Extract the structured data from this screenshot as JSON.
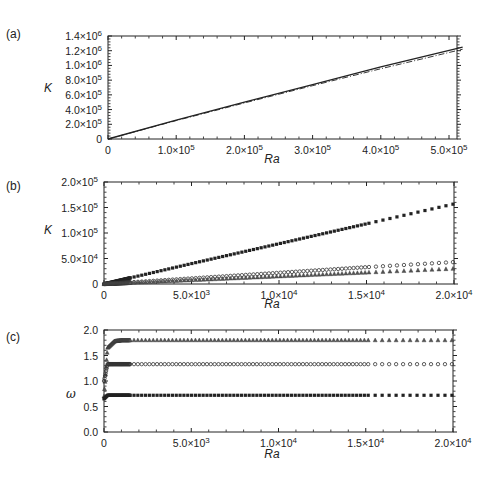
{
  "chart_data": [
    {
      "panel": "(a)",
      "type": "line",
      "title": "",
      "xlabel": "Ra",
      "ylabel": "K",
      "xlim": [
        0,
        530000
      ],
      "ylim": [
        0,
        1400000
      ],
      "xticks": [
        0,
        100000,
        200000,
        300000,
        400000,
        500000
      ],
      "xtick_labels": [
        "0",
        "1.0×10^5",
        "2.0×10^5",
        "3.0×10^5",
        "4.0×10^5",
        "5.0×10^5"
      ],
      "yticks": [
        0,
        200000,
        400000,
        600000,
        800000,
        1000000,
        1200000,
        1400000
      ],
      "ytick_labels": [
        "0",
        "2.0×10^5",
        "4.0×10^5",
        "6.0×10^5",
        "8.0×10^5",
        "1.0×10^6",
        "1.2×10^6",
        "1.4×10^6"
      ],
      "grid": false,
      "series": [
        {
          "name": "solid",
          "style": "solid",
          "x": [
            0,
            100000,
            200000,
            300000,
            400000,
            520000
          ],
          "values": [
            0,
            255000,
            500000,
            740000,
            980000,
            1250000
          ]
        },
        {
          "name": "dash-dot",
          "style": "dashdot",
          "x": [
            0,
            100000,
            200000,
            300000,
            400000,
            520000
          ],
          "values": [
            0,
            250000,
            490000,
            725000,
            955000,
            1220000
          ]
        }
      ]
    },
    {
      "panel": "(b)",
      "type": "scatter",
      "title": "",
      "xlabel": "Ra",
      "ylabel": "K",
      "xlim": [
        0,
        20000
      ],
      "ylim": [
        0,
        200000
      ],
      "xticks": [
        0,
        5000,
        10000,
        15000,
        20000
      ],
      "xtick_labels": [
        "0",
        "5.0×10^3",
        "1.0×10^4",
        "1.5×10^4",
        "2.0×10^4"
      ],
      "yticks": [
        0,
        50000,
        100000,
        150000,
        200000
      ],
      "ytick_labels": [
        "0",
        "5.0×10^4",
        "1.0×10^5",
        "1.5×10^5",
        "2.0×10^5"
      ],
      "grid": false,
      "series": [
        {
          "name": "squares",
          "marker": "square",
          "x": [
            0,
            5000,
            10000,
            15000,
            20000
          ],
          "values": [
            0,
            40000,
            79000,
            118000,
            157000
          ]
        },
        {
          "name": "circles",
          "marker": "circle",
          "x": [
            0,
            5000,
            10000,
            15000,
            20000
          ],
          "values": [
            0,
            11000,
            22000,
            33000,
            43000
          ]
        },
        {
          "name": "triangles",
          "marker": "triangle",
          "x": [
            0,
            5000,
            10000,
            15000,
            20000
          ],
          "values": [
            0,
            7500,
            15000,
            22500,
            30000
          ]
        }
      ]
    },
    {
      "panel": "(c)",
      "type": "scatter",
      "title": "",
      "xlabel": "Ra",
      "ylabel": "ω",
      "xlim": [
        0,
        20000
      ],
      "ylim": [
        0,
        2.0
      ],
      "xticks": [
        0,
        5000,
        10000,
        15000,
        20000
      ],
      "xtick_labels": [
        "0",
        "5.0×10^3",
        "1.0×10^4",
        "1.5×10^4",
        "2.0×10^4"
      ],
      "yticks": [
        0,
        0.5,
        1.0,
        1.5,
        2.0
      ],
      "ytick_labels": [
        "0.0",
        "0.5",
        "1.0",
        "1.5",
        "2.0"
      ],
      "grid": false,
      "series": [
        {
          "name": "triangles",
          "marker": "triangle",
          "x": [
            0,
            200,
            600,
            1000,
            20000
          ],
          "values": [
            0.7,
            1.65,
            1.78,
            1.8,
            1.8
          ]
        },
        {
          "name": "circles",
          "marker": "circle",
          "x": [
            0,
            200,
            20000
          ],
          "values": [
            1.0,
            1.33,
            1.33
          ]
        },
        {
          "name": "squares",
          "marker": "square",
          "x": [
            0,
            200,
            20000
          ],
          "values": [
            0.65,
            0.72,
            0.72
          ]
        }
      ]
    }
  ],
  "panels": {
    "a": {
      "label": "(a)",
      "xlabel": "Ra",
      "ylabel": "K"
    },
    "b": {
      "label": "(b)",
      "xlabel": "Ra",
      "ylabel": "K"
    },
    "c": {
      "label": "(c)",
      "xlabel": "Ra",
      "ylabel": "ω"
    }
  }
}
